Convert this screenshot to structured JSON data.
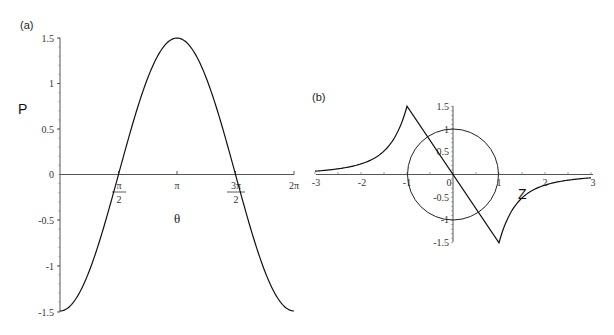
{
  "chart_data": [
    {
      "panel": "(a)",
      "type": "line",
      "title": "",
      "xlabel": "θ",
      "ylabel": "P",
      "xlim": [
        0,
        6.2832
      ],
      "ylim": [
        -1.5,
        1.5
      ],
      "x_ticks": [
        {
          "value": 1.5708,
          "num": "π",
          "den": "2"
        },
        {
          "value": 3.1416,
          "label": "π"
        },
        {
          "value": 4.7124,
          "num": "3π",
          "den": "2"
        },
        {
          "value": 6.2832,
          "label": "2π"
        }
      ],
      "y_ticks": [
        "-1.5",
        "-1",
        "-0.5",
        "0",
        "0.5",
        "1",
        "1.5"
      ],
      "grid": false,
      "series": [
        {
          "name": "P(θ)",
          "formula": "-1.5*cos(θ)",
          "x": [
            0,
            0.785,
            1.571,
            2.356,
            3.142,
            3.927,
            4.712,
            5.498,
            6.283
          ],
          "y": [
            -1.5,
            -1.06,
            0,
            1.06,
            1.5,
            1.06,
            0,
            -1.06,
            -1.5
          ]
        }
      ]
    },
    {
      "panel": "(b)",
      "type": "line",
      "title": "",
      "xlabel": "Z",
      "ylabel": "",
      "xlim": [
        -3,
        3
      ],
      "ylim": [
        -1.5,
        1.5
      ],
      "x_ticks": [
        "-3",
        "-2",
        "-1",
        "0",
        "1",
        "2",
        "3"
      ],
      "y_ticks": [
        "-1.5",
        "-1",
        "-0.5",
        "0.5",
        "1",
        "1.5"
      ],
      "grid": false,
      "series": [
        {
          "name": "curve",
          "x": [
            -3,
            -2.5,
            -2,
            -1.5,
            -1.2,
            -1,
            0,
            1,
            1.2,
            1.5,
            2,
            2.5,
            3
          ],
          "y": [
            0.2,
            0.26,
            0.38,
            0.62,
            0.95,
            1.5,
            0,
            -1.5,
            -0.95,
            -0.62,
            -0.38,
            -0.26,
            -0.2
          ]
        },
        {
          "name": "unit circle",
          "shape": "circle",
          "center": [
            0,
            0
          ],
          "radius": 1
        }
      ]
    }
  ],
  "labels": {
    "panel_a": "(a)",
    "panel_b": "(b)",
    "a_ylabel": "P",
    "a_xlabel": "θ",
    "b_xlabel": "Z",
    "a_yticks": [
      "1.5",
      "1",
      "0.5",
      "0",
      "-0.5",
      "-1",
      "-1.5"
    ],
    "a_xtick_pi_half_num": "π",
    "a_xtick_pi_half_den": "2",
    "a_xtick_pi": "π",
    "a_xtick_3pi_half_num": "3π",
    "a_xtick_3pi_half_den": "2",
    "a_xtick_2pi": "2π",
    "b_xticks": [
      "-3",
      "-2",
      "-1",
      "0",
      "1",
      "2",
      "3"
    ],
    "b_yticks": [
      "1.5",
      "1",
      "0.5",
      "-0.5",
      "-1",
      "-1.5"
    ]
  }
}
